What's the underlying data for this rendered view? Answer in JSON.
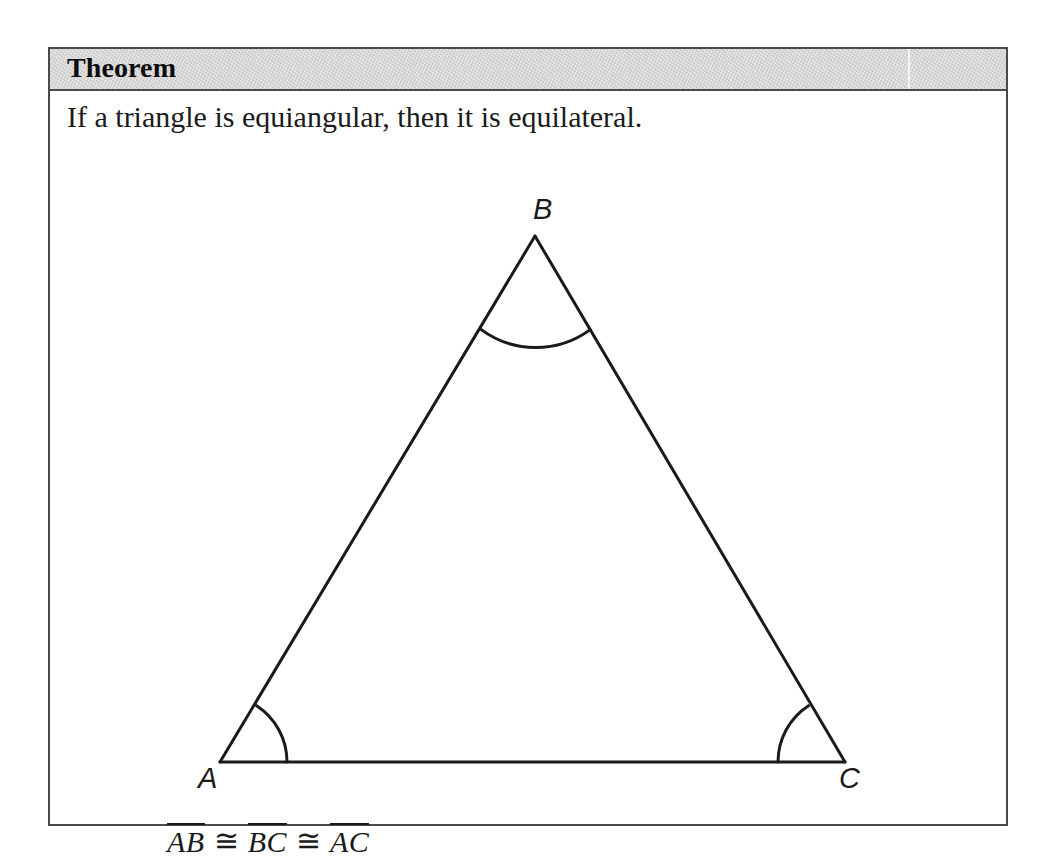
{
  "box": {
    "header_title": "Theorem",
    "statement": "If a triangle is equiangular, then it is equilateral.",
    "border_color": "#4a4a4a",
    "header_bg_color": "#d2d2d2",
    "text_color": "#1a1a1a"
  },
  "figure": {
    "type": "equilateral-triangle-diagram",
    "vertices": [
      {
        "name": "A",
        "label": "A",
        "x": 218,
        "y": 713
      },
      {
        "name": "B",
        "label": "B",
        "x": 533,
        "y": 187
      },
      {
        "name": "C",
        "label": "C",
        "x": 843,
        "y": 713
      }
    ],
    "angle_marks": [
      {
        "at": "A",
        "radius": 67
      },
      {
        "at": "B",
        "radius": 92
      },
      {
        "at": "C",
        "radius": 67
      }
    ],
    "stroke_color": "#1a1a1a",
    "stroke_width": 3
  },
  "congruence": {
    "segments": [
      "AB",
      "BC",
      "AC"
    ],
    "operator": "≅",
    "full_text": "AB ≅ BC ≅ AC"
  }
}
